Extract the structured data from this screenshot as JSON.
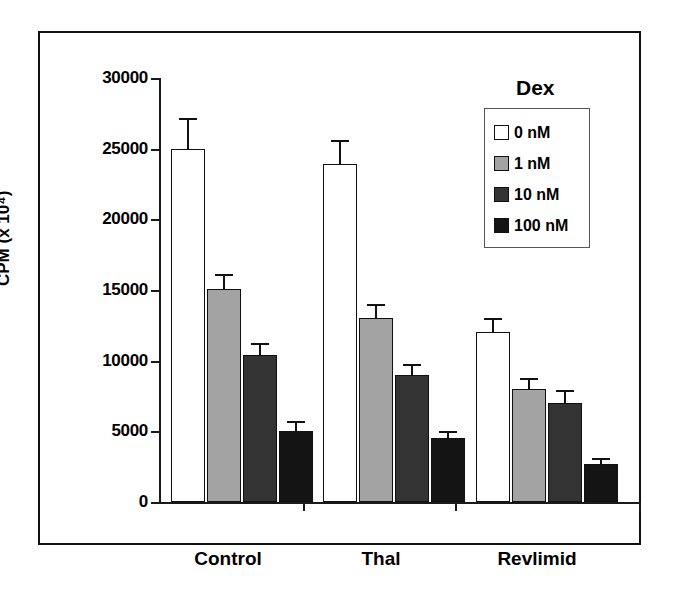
{
  "chart_data": {
    "type": "bar",
    "title": "",
    "xlabel": "",
    "ylabel": "CPM (x 10⁴)",
    "ylim": [
      0,
      30000
    ],
    "ytick_labels": [
      "30000",
      "25000",
      "20000",
      "15000",
      "10000",
      "5000",
      "0"
    ],
    "ytick_values": [
      30000,
      25000,
      20000,
      15000,
      10000,
      5000,
      0
    ],
    "grid": false,
    "legend_title": "Dex",
    "legend_position": "top-right",
    "categories": [
      "Control",
      "Thal",
      "Revlimid"
    ],
    "series": [
      {
        "name": "0 nM",
        "color": "#ffffff",
        "values": [
          25000,
          23900,
          12000
        ],
        "errors": [
          2000,
          1600,
          900
        ]
      },
      {
        "name": "1 nM",
        "color": "#a3a3a3",
        "values": [
          15100,
          13000,
          8000
        ],
        "errors": [
          900,
          900,
          600
        ]
      },
      {
        "name": "10 nM",
        "color": "#333333",
        "values": [
          10400,
          9000,
          7000
        ],
        "errors": [
          700,
          600,
          800
        ]
      },
      {
        "name": "100 nM",
        "color": "#141414",
        "values": [
          5000,
          4500,
          2700
        ],
        "errors": [
          600,
          400,
          300
        ]
      }
    ]
  },
  "axis": {
    "y_title": "CPM (x 10⁴)",
    "tick_0": "30000",
    "tick_1": "25000",
    "tick_2": "20000",
    "tick_3": "15000",
    "tick_4": "10000",
    "tick_5": "5000",
    "tick_6": "0"
  },
  "legend": {
    "title": "Dex",
    "items": [
      {
        "label": "0 nM",
        "color": "#ffffff"
      },
      {
        "label": "1 nM",
        "color": "#a3a3a3"
      },
      {
        "label": "10 nM",
        "color": "#333333"
      },
      {
        "label": "100 nM",
        "color": "#141414"
      }
    ]
  },
  "categories": {
    "c0": "Control",
    "c1": "Thal",
    "c2": "Revlimid"
  }
}
